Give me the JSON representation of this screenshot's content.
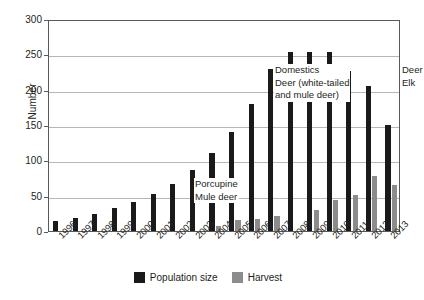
{
  "chart_data": {
    "type": "bar",
    "title": "",
    "xlabel": "",
    "ylabel": "Number",
    "ylim": [
      0,
      300
    ],
    "yticks": [
      0,
      50,
      100,
      150,
      200,
      250,
      300
    ],
    "grid": true,
    "legend_position": "bottom-center",
    "categories": [
      "1996",
      "1997",
      "1998",
      "1999",
      "2000",
      "2001",
      "2002",
      "2003",
      "2004",
      "2005",
      "2006",
      "2007",
      "2008",
      "2009",
      "2010",
      "2011",
      "2012",
      "2013"
    ],
    "series": [
      {
        "name": "Population size",
        "color": "#1a1a1a",
        "values": [
          14,
          18,
          24,
          32,
          41,
          52,
          67,
          86,
          110,
          140,
          180,
          229,
          254,
          254,
          254,
          227,
          205,
          150
        ]
      },
      {
        "name": "Harvest",
        "color": "#8c8c8c",
        "values": [
          0,
          0,
          0,
          0,
          0,
          0,
          0,
          0,
          7,
          15,
          17,
          21,
          0,
          30,
          44,
          51,
          78,
          65
        ]
      }
    ],
    "annotations": [
      {
        "id": "porcupine",
        "lines": [
          "Porcupine",
          "Mule deer"
        ]
      },
      {
        "id": "domestics",
        "lines": [
          "Domestics",
          "Deer (white-tailed",
          "and mule deer)"
        ]
      },
      {
        "id": "deer-elk",
        "lines": [
          "Deer",
          "Elk"
        ]
      }
    ]
  },
  "legend": {
    "items": [
      {
        "label": "Population size",
        "color": "#1a1a1a"
      },
      {
        "label": "Harvest",
        "color": "#8c8c8c"
      }
    ]
  }
}
